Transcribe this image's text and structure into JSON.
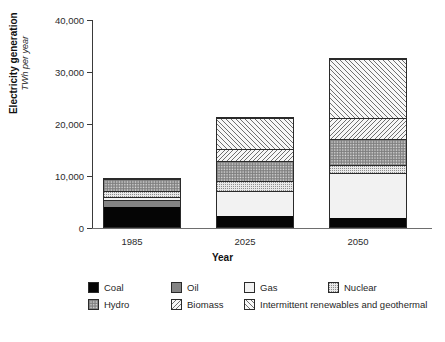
{
  "chart_data": {
    "type": "bar",
    "subtype": "stacked-vertical",
    "title": "",
    "xlabel": "Year",
    "ylabel": "Electricity generation",
    "ylabel_units": "TWh per year",
    "categories": [
      "1985",
      "2025",
      "2050"
    ],
    "ylim": [
      0,
      40000
    ],
    "yticks": [
      "0",
      "10,000",
      "20,000",
      "30,000",
      "40,000"
    ],
    "ytick_values": [
      0,
      10000,
      20000,
      30000,
      40000
    ],
    "grid": false,
    "legend_position": "bottom",
    "series": [
      {
        "name": "Coal",
        "pattern": "solid-black",
        "values": [
          3800,
          2200,
          1800
        ]
      },
      {
        "name": "Oil",
        "pattern": "solid-grey",
        "values": [
          1400,
          0,
          0
        ]
      },
      {
        "name": "Gas",
        "pattern": "solid-white",
        "values": [
          500,
          4800,
          8600
        ]
      },
      {
        "name": "Nuclear",
        "pattern": "fine-dots",
        "values": [
          1200,
          1900,
          1600
        ]
      },
      {
        "name": "Hydro",
        "pattern": "dense-dots",
        "values": [
          2300,
          3800,
          5000
        ]
      },
      {
        "name": "Biomass",
        "pattern": "backslash-hatch",
        "values": [
          0,
          2300,
          4000
        ]
      },
      {
        "name": "Intermittent renewables and geothermal",
        "pattern": "forwardslash-hatch",
        "values": [
          0,
          6000,
          11400
        ]
      }
    ],
    "totals": [
      9200,
      21000,
      32400
    ]
  },
  "axis": {
    "y_title_main": "Electricity generation",
    "y_title_sub": "TWh per year",
    "x_title": "Year"
  },
  "legend": {
    "row1": [
      {
        "label": "Coal",
        "swatch": "coal-swatch"
      },
      {
        "label": "Oil",
        "swatch": "oil-swatch"
      },
      {
        "label": "Gas",
        "swatch": "gas-swatch"
      },
      {
        "label": "Nuclear",
        "swatch": "nuclear-swatch"
      }
    ],
    "row2": [
      {
        "label": "Hydro",
        "swatch": "hydro-swatch"
      },
      {
        "label": "Biomass",
        "swatch": "biomass-swatch"
      },
      {
        "label": "Intermittent renewables and geothermal",
        "swatch": "intermittent-swatch"
      }
    ]
  },
  "colors": {
    "coal": "#050505",
    "oil": "#848484",
    "gas": "#f2f2f2",
    "axis": "#3a3a3a",
    "outline": "#2a2a2a",
    "background": "#ffffff"
  }
}
